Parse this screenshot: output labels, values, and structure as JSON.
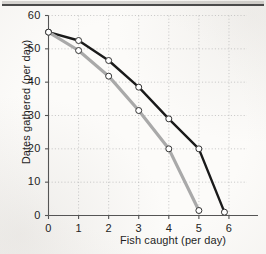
{
  "chart_data": {
    "type": "line",
    "title": "",
    "xlabel": "Fish caught (per day)",
    "ylabel": "Dates gathered (per day)",
    "xlim": [
      0,
      6.6
    ],
    "ylim": [
      0,
      60
    ],
    "xticks": [
      0,
      1,
      2,
      3,
      4,
      5,
      6
    ],
    "yticks": [
      0,
      10,
      20,
      30,
      40,
      50,
      60
    ],
    "xtick_labels": [
      "0",
      "1",
      "2",
      "3",
      "4",
      "5",
      "6"
    ],
    "ytick_labels": [
      "0",
      "10",
      "20",
      "30",
      "40",
      "50",
      "60"
    ],
    "grid": true,
    "grid_style": "dotted",
    "legend": "none",
    "marker": "open-circle",
    "series": [
      {
        "name": "black-curve",
        "color": "#1a1a1a",
        "x": [
          0,
          1,
          2,
          3,
          4,
          5,
          5.85
        ],
        "values": [
          55,
          52.5,
          46.5,
          38.5,
          29,
          20,
          1
        ]
      },
      {
        "name": "gray-curve",
        "color": "#a9a9a9",
        "x": [
          0,
          1,
          2,
          3,
          4,
          5
        ],
        "values": [
          55,
          49.5,
          41.8,
          31.5,
          20,
          1.5
        ]
      }
    ]
  },
  "axes": {
    "x_title": "Fish caught (per day)",
    "y_title": "Dates gathered (per day)"
  },
  "colors": {
    "black_line": "#1a1a1a",
    "gray_line": "#a9a9a9",
    "axis": "#555555",
    "grid": "#b9b9b9",
    "marker_fill": "#ffffff",
    "paper": "#fcfbf9",
    "rule": "#4a4a4a"
  }
}
